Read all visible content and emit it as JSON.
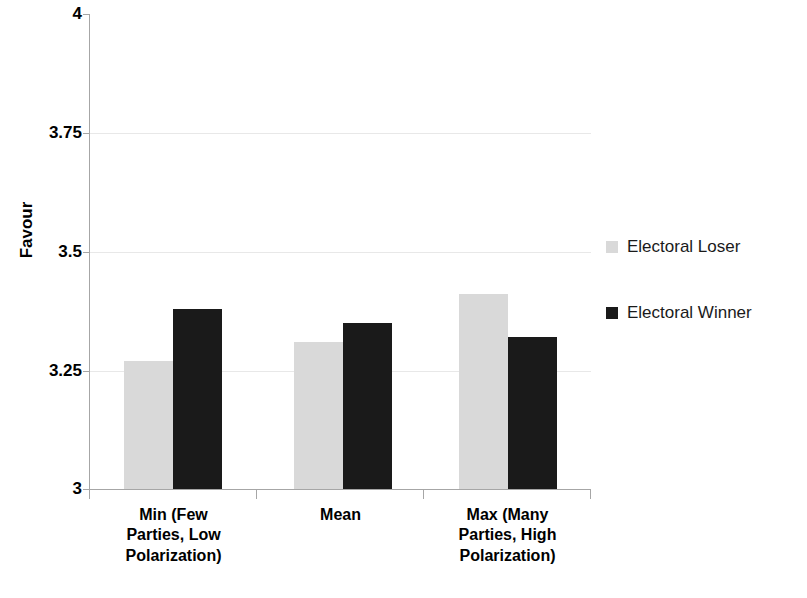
{
  "chart_data": {
    "type": "bar",
    "title": "",
    "xlabel": "",
    "ylabel": "Favour",
    "ylim": [
      3,
      4
    ],
    "yticks": [
      "3",
      "3.25",
      "3.5",
      "3.75",
      "4"
    ],
    "ytick_values": [
      3,
      3.25,
      3.5,
      3.75,
      4
    ],
    "grid": true,
    "legend_position": "right",
    "categories": [
      "Min (Few Parties, Low Polarization)",
      "Mean",
      "Max (Many Parties, High Polarization)"
    ],
    "category_lines": [
      [
        "Min (Few",
        "Parties, Low",
        "Polarization)"
      ],
      [
        "Mean"
      ],
      [
        "Max (Many",
        "Parties, High",
        "Polarization)"
      ]
    ],
    "series": [
      {
        "name": "Electoral Loser",
        "color": "#d9d9d9",
        "values": [
          3.27,
          3.31,
          3.41
        ]
      },
      {
        "name": "Electoral Winner",
        "color": "#1a1a1a",
        "values": [
          3.38,
          3.35,
          3.32
        ]
      }
    ]
  },
  "legend": {
    "items": [
      {
        "label": "Electoral Loser",
        "color": "#d9d9d9"
      },
      {
        "label": "Electoral Winner",
        "color": "#1a1a1a"
      }
    ]
  },
  "axis": {
    "y_title": "Favour",
    "tick_4": "4",
    "tick_375": "3.75",
    "tick_35": "3.5",
    "tick_325": "3.25",
    "tick_3": "3"
  },
  "x_labels": {
    "cat0_line0": "Min (Few",
    "cat0_line1": "Parties, Low",
    "cat0_line2": "Polarization)",
    "cat1_line0": "Mean",
    "cat2_line0": "Max (Many",
    "cat2_line1": "Parties, High",
    "cat2_line2": "Polarization)"
  },
  "colors": {
    "loser": "#d9d9d9",
    "winner": "#1a1a1a",
    "axis": "#a6a6a6",
    "grid": "#e8e8e8"
  }
}
